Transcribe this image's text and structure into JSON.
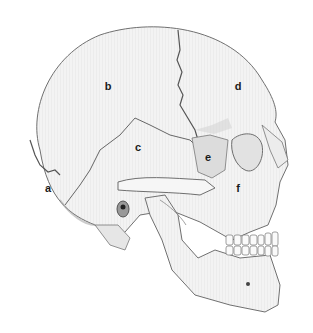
{
  "figure": {
    "labels": [
      {
        "id": "a",
        "text": "a",
        "x": 48,
        "y": 188
      },
      {
        "id": "b",
        "text": "b",
        "x": 108,
        "y": 86
      },
      {
        "id": "c",
        "text": "c",
        "x": 138,
        "y": 147
      },
      {
        "id": "d",
        "text": "d",
        "x": 238,
        "y": 86
      },
      {
        "id": "e",
        "text": "e",
        "x": 208,
        "y": 157
      },
      {
        "id": "f",
        "text": "f",
        "x": 238,
        "y": 188
      }
    ],
    "colors": {
      "bone": "#f2f2f2",
      "shade": "#cfcfcf",
      "line": "#6e6e6e",
      "background": "#ffffff"
    }
  }
}
